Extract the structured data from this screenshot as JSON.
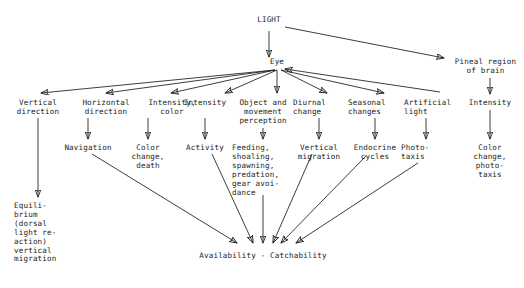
{
  "diagram": {
    "title": "LIGHT",
    "type": "flow-diagram",
    "background_color": "#ffffff",
    "ink_color": "#1b1b1b",
    "nodes": {
      "light": "LIGHT",
      "eye": "Eye",
      "pineal": "Pineal region\nof brain",
      "vertical_direction": "Vertical\ndirection",
      "horizontal_direction": "Horizontal\ndirection",
      "intensity_color": "Intensity,\ncolor",
      "intensity": "Intensity",
      "object_movement": "Object and\nmovement\nperception",
      "diurnal_change": "Diurnal\nchange",
      "seasonal_changes": "Seasonal\nchanges",
      "artificial_light": "Artificial\nlight",
      "intensity_right": "Intensity",
      "navigation": "Navigation",
      "color_change_death": "Color\nchange,\ndeath",
      "activity": "Activity",
      "feeding": "Feeding,\nshoaling,\nspawning,\npredation,\ngear avoi-\ndance",
      "vertical_migration": "Vertical\nmigration",
      "endocrine_cycles": "Endocrine\ncycles",
      "phototaxis": "Photo-\ntaxis",
      "color_change_phototaxis": "Color\nchange,\nphoto-\ntaxis",
      "equilibrium": "Equili-\nbrium\n(dorsal\nlight re-\naction)\nvertical\nmigration",
      "availability": "Availability - Catchability"
    },
    "edges": [
      {
        "from": "light",
        "to": "eye"
      },
      {
        "from": "light",
        "to": "pineal"
      },
      {
        "from": "eye",
        "to": "vertical_direction"
      },
      {
        "from": "eye",
        "to": "horizontal_direction"
      },
      {
        "from": "eye",
        "to": "intensity_color"
      },
      {
        "from": "eye",
        "to": "intensity"
      },
      {
        "from": "eye",
        "to": "object_movement"
      },
      {
        "from": "eye",
        "to": "diurnal_change"
      },
      {
        "from": "eye",
        "to": "seasonal_changes"
      },
      {
        "from": "artificial_light",
        "to": "eye"
      },
      {
        "from": "pineal",
        "to": "intensity_right"
      },
      {
        "from": "vertical_direction",
        "to": "equilibrium"
      },
      {
        "from": "horizontal_direction",
        "to": "navigation"
      },
      {
        "from": "intensity_color",
        "to": "color_change_death"
      },
      {
        "from": "intensity",
        "to": "activity"
      },
      {
        "from": "object_movement",
        "to": "feeding"
      },
      {
        "from": "diurnal_change",
        "to": "vertical_migration"
      },
      {
        "from": "seasonal_changes",
        "to": "endocrine_cycles"
      },
      {
        "from": "artificial_light",
        "to": "phototaxis"
      },
      {
        "from": "intensity_right",
        "to": "color_change_phototaxis"
      },
      {
        "from": "navigation",
        "to": "availability"
      },
      {
        "from": "activity",
        "to": "availability"
      },
      {
        "from": "feeding",
        "to": "availability"
      },
      {
        "from": "vertical_migration",
        "to": "availability"
      },
      {
        "from": "endocrine_cycles",
        "to": "availability"
      },
      {
        "from": "phototaxis",
        "to": "availability"
      }
    ]
  }
}
